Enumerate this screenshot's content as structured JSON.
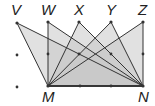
{
  "diagram": {
    "title": "",
    "fill_color": "#c8c8c8",
    "fill_opacity": 0.55,
    "line_color": "#333333",
    "points": {
      "V": {
        "label": "V",
        "x": 17,
        "y": 23
      },
      "W": {
        "label": "W",
        "x": 48,
        "y": 22
      },
      "X": {
        "label": "X",
        "x": 79,
        "y": 22
      },
      "Y": {
        "label": "Y",
        "x": 111,
        "y": 22
      },
      "Z": {
        "label": "Z",
        "x": 143,
        "y": 22
      },
      "M": {
        "label": "M",
        "x": 48,
        "y": 86
      },
      "N": {
        "label": "N",
        "x": 143,
        "y": 86
      }
    },
    "triangles": [
      [
        "V",
        "M",
        "N"
      ],
      [
        "W",
        "M",
        "N"
      ],
      [
        "X",
        "M",
        "N"
      ],
      [
        "Y",
        "M",
        "N"
      ],
      [
        "Z",
        "M",
        "N"
      ]
    ],
    "grid_dots": [
      [
        17,
        55
      ],
      [
        48,
        54
      ],
      [
        79,
        54
      ],
      [
        111,
        54
      ],
      [
        143,
        54
      ],
      [
        17,
        87
      ],
      [
        80,
        86
      ],
      [
        111,
        86
      ]
    ]
  }
}
